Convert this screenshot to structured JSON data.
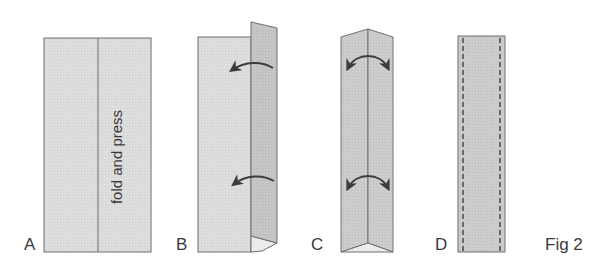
{
  "figure": {
    "caption": "Fig 2",
    "colors": {
      "paper_light": "#dedede",
      "paper_mid": "#cfcfcf",
      "paper_dark": "#bdbdbd",
      "paper_fold_light": "#ececec",
      "outline": "#6e6e6e",
      "arrow": "#3c3c3c",
      "stitch": "#333333",
      "text": "#3a3a3a"
    },
    "steps": [
      {
        "id": "A",
        "label": "A",
        "annotation": "fold and press",
        "description": "flat strip with center fold line"
      },
      {
        "id": "B",
        "label": "B",
        "description": "right half folded up, arrows indicating fold toward left"
      },
      {
        "id": "C",
        "label": "C",
        "description": "strip folded along center, arrows indicating both edges folding in"
      },
      {
        "id": "D",
        "label": "D",
        "description": "finished folded strip with stitching along both edges"
      }
    ]
  }
}
